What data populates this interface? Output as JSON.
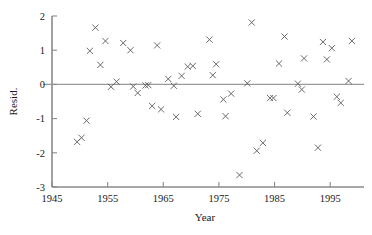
{
  "chart_data": {
    "type": "scatter",
    "title": "",
    "xlabel": "Year",
    "ylabel": "Resid.",
    "xlim": [
      1945,
      2000
    ],
    "ylim": [
      -3,
      2
    ],
    "xticks": [
      1945,
      1955,
      1965,
      1975,
      1985,
      1995
    ],
    "xticklabels": [
      "1945",
      "1955",
      "1965",
      "1975",
      "1985",
      "1995"
    ],
    "yticks": [
      -3,
      -2,
      -1,
      0,
      1,
      2
    ],
    "yticklabels": [
      "-3",
      "-2",
      "-1",
      "0",
      "1",
      "2"
    ],
    "grid": false,
    "legend": null,
    "marker": "x",
    "marker_color": "#5a5a5a",
    "axis_color": "#8a8a8a",
    "reference_lines": [
      {
        "axis": "y",
        "value": 0,
        "color": "#9a9a9a"
      }
    ],
    "series": [
      {
        "name": "Residuals",
        "points": [
          [
            1949.5,
            -1.68
          ],
          [
            1950.3,
            -1.56
          ],
          [
            1951.2,
            -1.06
          ],
          [
            1951.8,
            0.98
          ],
          [
            1952.8,
            1.66
          ],
          [
            1953.7,
            0.57
          ],
          [
            1954.6,
            1.27
          ],
          [
            1955.6,
            -0.07
          ],
          [
            1956.6,
            0.08
          ],
          [
            1957.8,
            1.21
          ],
          [
            1959.1,
            1.0
          ],
          [
            1959.6,
            -0.06
          ],
          [
            1960.4,
            -0.25
          ],
          [
            1961.8,
            -0.03
          ],
          [
            1962.3,
            -0.02
          ],
          [
            1963.0,
            -0.63
          ],
          [
            1963.9,
            1.14
          ],
          [
            1964.6,
            -0.73
          ],
          [
            1965.9,
            0.16
          ],
          [
            1966.9,
            -0.04
          ],
          [
            1967.3,
            -0.95
          ],
          [
            1968.3,
            0.25
          ],
          [
            1969.4,
            0.52
          ],
          [
            1970.3,
            0.54
          ],
          [
            1971.2,
            -0.86
          ],
          [
            1973.3,
            1.31
          ],
          [
            1973.9,
            0.27
          ],
          [
            1974.5,
            0.59
          ],
          [
            1975.8,
            -0.44
          ],
          [
            1976.2,
            -0.93
          ],
          [
            1977.2,
            -0.27
          ],
          [
            1978.7,
            -2.65
          ],
          [
            1980.1,
            0.03
          ],
          [
            1980.9,
            1.81
          ],
          [
            1981.8,
            -1.94
          ],
          [
            1982.9,
            -1.71
          ],
          [
            1984.2,
            -0.4
          ],
          [
            1984.8,
            -0.4
          ],
          [
            1985.8,
            0.61
          ],
          [
            1986.8,
            1.4
          ],
          [
            1987.3,
            -0.83
          ],
          [
            1989.2,
            0.02
          ],
          [
            1989.9,
            -0.15
          ],
          [
            1990.3,
            0.76
          ],
          [
            1992.0,
            -0.94
          ],
          [
            1992.8,
            -1.85
          ],
          [
            1993.7,
            1.24
          ],
          [
            1994.4,
            0.73
          ],
          [
            1995.3,
            1.06
          ],
          [
            1996.2,
            -0.36
          ],
          [
            1996.9,
            -0.54
          ],
          [
            1998.3,
            0.1
          ],
          [
            1998.9,
            1.27
          ]
        ]
      }
    ]
  }
}
